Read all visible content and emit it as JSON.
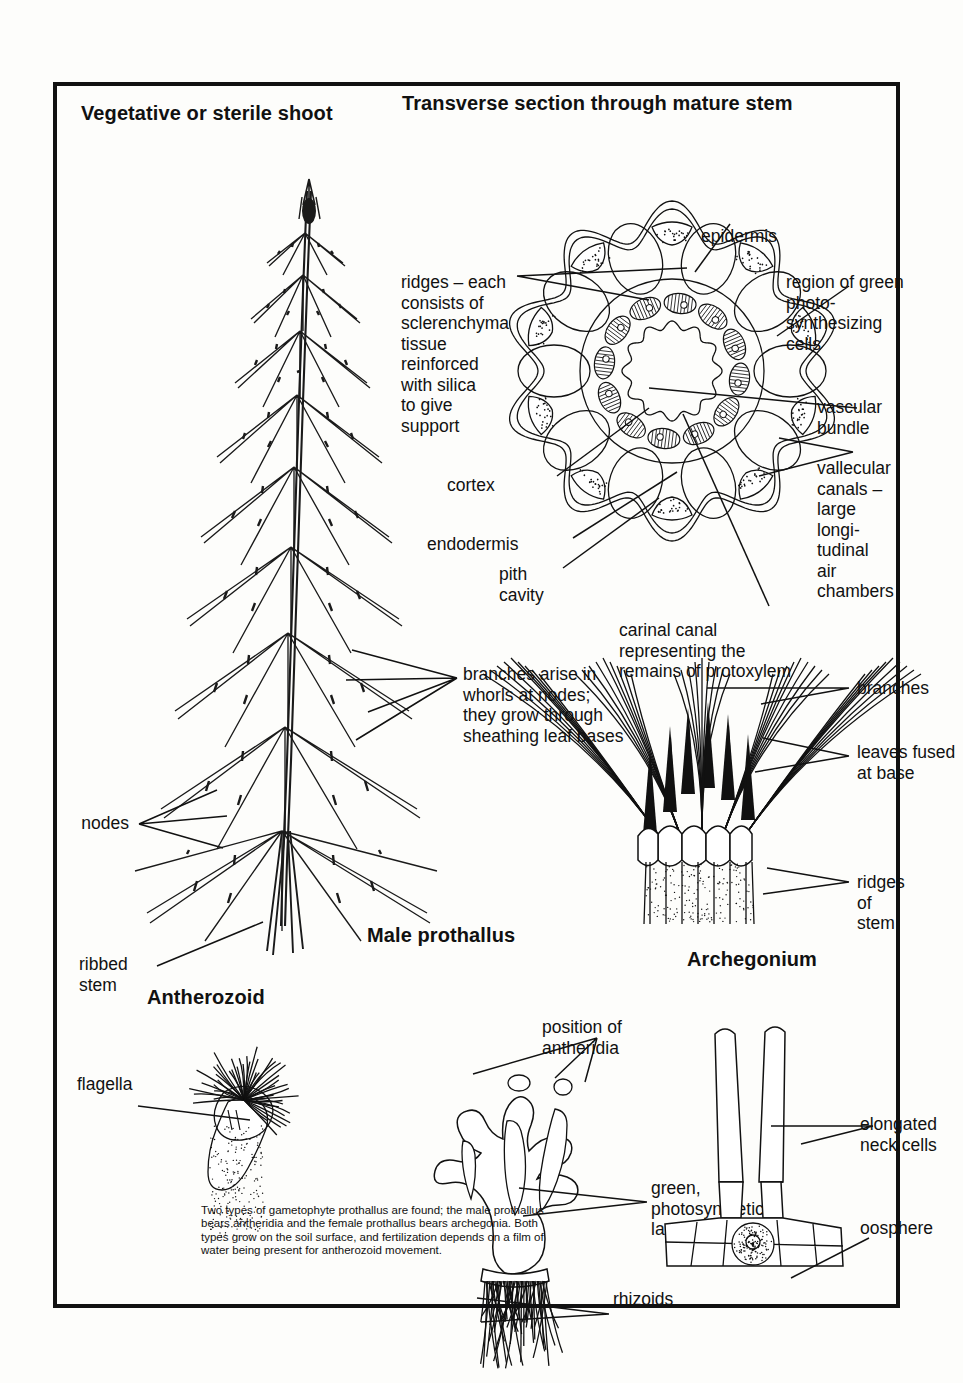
{
  "plate": {
    "titles": {
      "vegetative_shoot": "Vegetative or sterile shoot",
      "transverse_section": "Transverse section through mature stem",
      "male_prothallus": "Male prothallus",
      "antherozoid": "Antherozoid",
      "archegonium": "Archegonium"
    },
    "labels": {
      "epidermis": "epidermis",
      "ridges": "ridges – each\nconsists of\nsclerenchyma\ntissue\nreinforced\nwith silica\nto give\nsupport",
      "region_green": "region of green\nphoto-\nsynthesizing\ncells",
      "vascular_bundle": "vascular\nbundle",
      "vallecular": "vallecular\ncanals –\nlarge\nlongi-\ntudinal\nair\nchambers",
      "cortex": "cortex",
      "endodermis": "endodermis",
      "pith_cavity": "pith\ncavity",
      "carinal_canal": "carinal canal\nrepresenting the\nremains of protoxylem",
      "branches_whorls": "branches arise in\nwhorls at nodes;\nthey grow through\nsheathing leaf bases",
      "nodes": "nodes",
      "ribbed_stem": "ribbed\nstem",
      "branches": "branches",
      "leaves_fused": "leaves fused\nat base",
      "ridges_of_stem": "ridges of stem",
      "flagella": "flagella",
      "position_antheridia": "position of\nantheridia",
      "green_lamellae": "green,\nphotosynthetic\nlamellae",
      "rhizoids": "rhizoids",
      "elongated_neck_cells": "elongated\nneck cells",
      "oosphere": "oosphere"
    },
    "caption": "Two types of gametophyte prothallus are found; the male prothallus bears antheridia and the female prothallus bears archegonia. Both types grow on the soil surface, and fertilization depends on a film of water being present for antherozoid movement.",
    "colors": {
      "ink": "#111111",
      "paper": "#fdfdfb",
      "border": "#111111"
    }
  }
}
